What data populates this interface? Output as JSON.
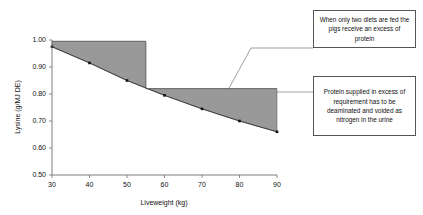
{
  "chart_data": {
    "type": "area",
    "title": "",
    "xlabel": "Liveweight (kg)",
    "ylabel": "Lysine (g/MJ DE)",
    "xlim": [
      30,
      90
    ],
    "ylim": [
      0.5,
      1.0
    ],
    "xticks": [
      30,
      40,
      50,
      60,
      70,
      80,
      90
    ],
    "yticks": [
      "0.50",
      "0.60",
      "0.70",
      "0.80",
      "0.90",
      "1.00"
    ],
    "grid": false,
    "legend": "none",
    "series": [
      {
        "name": "Lysine requirement",
        "type": "line",
        "marker": "filled-square",
        "x": [
          30,
          40,
          50,
          60,
          70,
          80,
          90
        ],
        "values": [
          0.975,
          0.915,
          0.85,
          0.795,
          0.745,
          0.7,
          0.66
        ]
      },
      {
        "name": "Diet lysine supplied (two diets)",
        "type": "step",
        "x": [
          30,
          55,
          55,
          90
        ],
        "values": [
          0.995,
          0.995,
          0.82,
          0.82
        ]
      }
    ],
    "shaded_region": {
      "label": "Excess protein supplied",
      "color": "#999999",
      "between": [
        "Diet lysine supplied (two diets)",
        "Lysine requirement"
      ]
    },
    "annotations": [
      {
        "id": "anno-1",
        "text": "When only two diets are fed the pigs receive an excess of protein",
        "leader_to": [
          70,
          0.82
        ]
      },
      {
        "id": "anno-2",
        "text": "Protein supplied in excess of requirement has to be deaminated and voided as nitrogen in the urine",
        "leader_to": [
          90,
          0.82
        ]
      }
    ]
  },
  "axes": {
    "x_label": "Liveweight (kg)",
    "y_label": "Lysine (g/MJ DE)",
    "x_tick_labels": [
      "30",
      "40",
      "50",
      "60",
      "70",
      "80",
      "90"
    ],
    "y_tick_labels": [
      "0.50",
      "0.60",
      "0.70",
      "0.80",
      "0.90",
      "1.00"
    ]
  },
  "annotations": {
    "box1": "When only two diets are fed the pigs receive an excess of protein",
    "box2": "Protein supplied in excess of requirement has to be deaminated and voided as nitrogen in the urine"
  },
  "colors": {
    "shaded_area": "#999999",
    "axis": "#6f6f6f",
    "text": "#111111",
    "box_border": "#555555",
    "background": "#ffffff"
  }
}
